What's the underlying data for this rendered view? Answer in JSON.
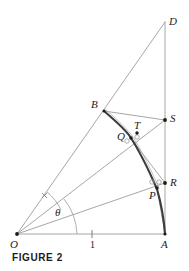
{
  "figure": {
    "caption": "FIGURE 2",
    "labels": {
      "D": "D",
      "B": "B",
      "S": "S",
      "T": "T",
      "Q": "Q",
      "R": "R",
      "P": "P",
      "O": "O",
      "A": "A",
      "theta": "θ",
      "unit": "1"
    },
    "colors": {
      "line": "#8a8a8a",
      "curve": "#4a4a4a",
      "point": "#1b1b1b",
      "text": "#1b1b1b",
      "background": "#ffffff"
    },
    "geometry": {
      "O": [
        17,
        234
      ],
      "A": [
        165,
        234
      ],
      "D": [
        165,
        22
      ],
      "B": [
        104,
        111
      ],
      "S": [
        165,
        120
      ],
      "T": [
        137,
        133
      ],
      "Q": [
        130,
        137
      ],
      "R": [
        165,
        183
      ],
      "P": [
        157,
        188
      ],
      "unit_tick": [
        92,
        234
      ],
      "theta_label": [
        58,
        212
      ],
      "angle_mark": [
        44,
        196
      ]
    }
  }
}
